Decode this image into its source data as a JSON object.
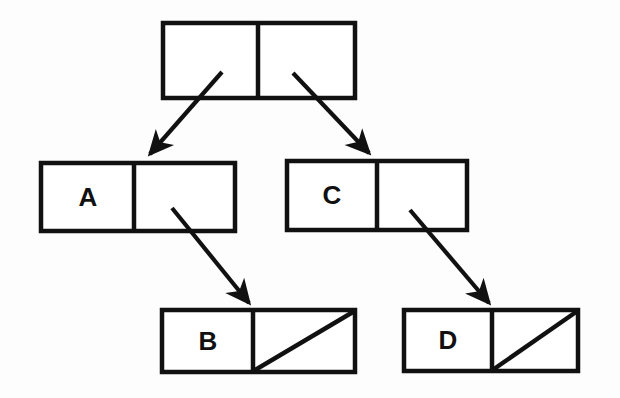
{
  "figure": {
    "background_color": "#fdfdfd",
    "ink_color": "#111111",
    "stroke_width": 4.5
  },
  "diagram_data": {
    "type": "node-link-diagram",
    "description": "Four two-cell boxes connected by four arrows; root box is empty, second level boxes hold A and C, third level boxes hold B and D with diagonal null markers",
    "nodes": [
      {
        "id": "root",
        "label": "",
        "left_cell_text": "",
        "right_cell_text": "",
        "left_cell_null": false,
        "right_cell_null": false,
        "box": {
          "x": 163,
          "y": 23,
          "width": 192,
          "height": 75,
          "divider_x": 258
        }
      },
      {
        "id": "a",
        "label": "A",
        "left_cell_text": "A",
        "right_cell_text": "",
        "left_cell_null": false,
        "right_cell_null": false,
        "box": {
          "x": 41,
          "y": 163,
          "width": 194,
          "height": 68,
          "divider_x": 134
        }
      },
      {
        "id": "c",
        "label": "C",
        "left_cell_text": "C",
        "right_cell_text": "",
        "left_cell_null": false,
        "right_cell_null": false,
        "box": {
          "x": 287,
          "y": 161,
          "width": 180,
          "height": 69,
          "divider_x": 377
        }
      },
      {
        "id": "b",
        "label": "B",
        "left_cell_text": "B",
        "right_cell_text": "",
        "left_cell_null": false,
        "right_cell_null": true,
        "box": {
          "x": 162,
          "y": 310,
          "width": 193,
          "height": 62,
          "divider_x": 253
        }
      },
      {
        "id": "d",
        "label": "D",
        "left_cell_text": "D",
        "right_cell_text": "",
        "left_cell_null": false,
        "right_cell_null": true,
        "box": {
          "x": 404,
          "y": 310,
          "width": 174,
          "height": 61,
          "divider_x": 492
        }
      }
    ],
    "edges": [
      {
        "id": "root-left-to-a",
        "from": "root",
        "from_cell": "left",
        "to": "a",
        "x1": 222,
        "y1": 72,
        "x2": 147,
        "y2": 158
      },
      {
        "id": "root-right-to-c",
        "from": "root",
        "from_cell": "right",
        "to": "c",
        "x1": 293,
        "y1": 73,
        "x2": 372,
        "y2": 157
      },
      {
        "id": "a-right-to-b",
        "from": "a",
        "from_cell": "right",
        "to": "b",
        "x1": 172,
        "y1": 208,
        "x2": 252,
        "y2": 307
      },
      {
        "id": "c-right-to-d",
        "from": "c",
        "from_cell": "right",
        "to": "d",
        "x1": 410,
        "y1": 210,
        "x2": 492,
        "y2": 307
      }
    ]
  }
}
